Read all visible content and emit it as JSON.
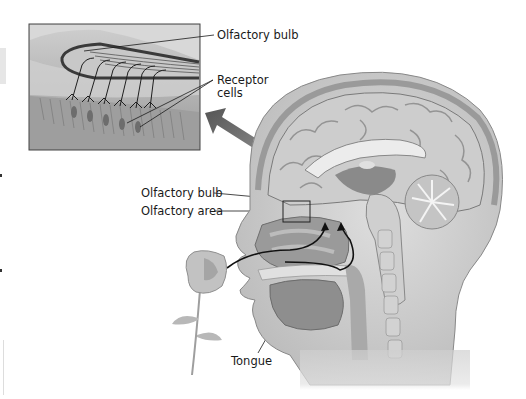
{
  "diagram": {
    "labels": {
      "inset_olfactory_bulb": "Olfactory bulb",
      "receptor_cells_line1": "Receptor",
      "receptor_cells_line2": "cells",
      "olfactory_bulb": "Olfactory bulb",
      "olfactory_area": "Olfactory area",
      "tongue": "Tongue"
    },
    "colors": {
      "background": "#ffffff",
      "tissue_light": "#d9d9d9",
      "tissue_mid": "#a8a8a8",
      "tissue_dark": "#6e6e6e",
      "label_text": "#1a1a1a",
      "arrow": "#666666"
    }
  }
}
